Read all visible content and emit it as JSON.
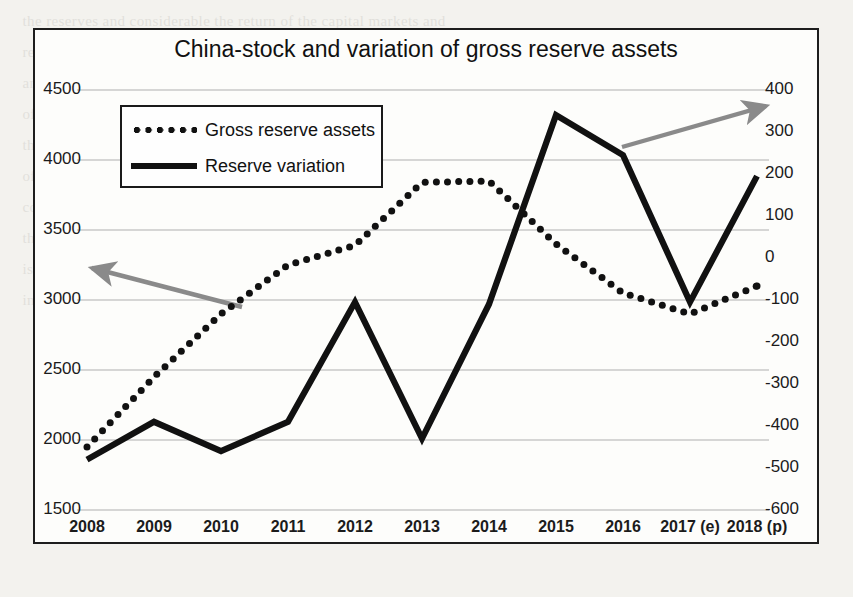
{
  "figure": {
    "title": "China-stock and variation of gross reserve assets"
  },
  "legend": {
    "items": [
      {
        "label": "Gross reserve assets",
        "style": "dotted",
        "swatch_name": "legend-swatch-dotted"
      },
      {
        "label": "Reserve variation",
        "style": "solid",
        "swatch_name": "legend-swatch-solid"
      }
    ]
  },
  "annotations": [
    {
      "name": "arrow-to-left-axis",
      "direction": "left",
      "color": "#8a8a8a"
    },
    {
      "name": "arrow-to-right-axis",
      "direction": "up-right",
      "color": "#8a8a8a"
    }
  ],
  "colors": {
    "series_gross_reserve_assets": "#111111",
    "series_reserve_variation": "#111111",
    "gridline": "#c9c9c9",
    "arrow": "#8a8a8a",
    "frame": "#1d1d1d",
    "text": "#1b1b1b",
    "plot_background": "#fdfdfb"
  },
  "chart_data": {
    "type": "line",
    "title": "China-stock and variation of gross reserve assets",
    "xlabel": "",
    "ylabel": "",
    "grid": true,
    "legend_position": "upper-left-inside",
    "categories": [
      "2008",
      "2009",
      "2010",
      "2011",
      "2012",
      "2013",
      "2014",
      "2015",
      "2016",
      "2017 (e)",
      "2018 (p)"
    ],
    "axes": {
      "left": {
        "name": "Gross reserve assets",
        "ylim": [
          1500,
          4500
        ],
        "ticks": [
          1500,
          2000,
          2500,
          3000,
          3500,
          4000,
          4500
        ],
        "tick_labels": [
          "1500",
          "2000",
          "2500",
          "3000",
          "3500",
          "4000",
          "4500"
        ]
      },
      "right": {
        "name": "Reserve variation",
        "ylim": [
          -600,
          400
        ],
        "ticks": [
          -600,
          -500,
          -400,
          -300,
          -200,
          -100,
          0,
          100,
          200,
          300,
          400
        ],
        "tick_labels": [
          "-600",
          "-500",
          "-400",
          "-300",
          "-200",
          "-100",
          "0",
          "100",
          "200",
          "300",
          "400"
        ]
      }
    },
    "series": [
      {
        "name": "Gross reserve assets",
        "axis": "left",
        "style": "dotted",
        "values": [
          1950,
          2450,
          2900,
          3250,
          3390,
          3840,
          3850,
          3400,
          3050,
          2900,
          3100
        ]
      },
      {
        "name": "Reserve variation",
        "axis": "right",
        "style": "solid",
        "values": [
          -480,
          -390,
          -460,
          -390,
          -105,
          -430,
          -110,
          340,
          245,
          -105,
          195
        ]
      }
    ]
  }
}
